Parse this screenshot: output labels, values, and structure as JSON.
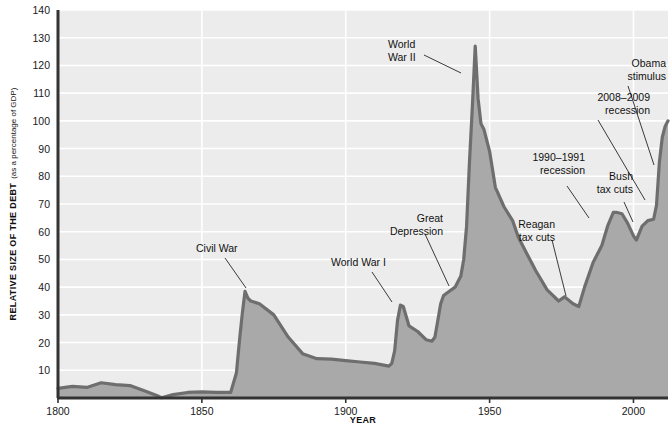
{
  "figure": {
    "background": "#ffffff",
    "plot_background": "#ececec",
    "gridline_color": "#ffffff",
    "fill_color": "#a9a9a9",
    "line_color": "#6e6e6e",
    "axis_color": "#333333",
    "text_color": "#111111"
  },
  "axes": {
    "y_title_bold": "RELATIVE SIZE OF THE DEBT",
    "y_title_regular": "(as a percentage of GDP)",
    "x_title": "YEAR",
    "y_ticks": [
      "10",
      "20",
      "30",
      "40",
      "50",
      "60",
      "70",
      "80",
      "90",
      "100",
      "110",
      "120",
      "130",
      "140"
    ],
    "x_ticks": [
      "1800",
      "1850",
      "1900",
      "1950",
      "2000"
    ]
  },
  "annotations": [
    {
      "name": "civil-war",
      "lines": [
        "Civil War"
      ]
    },
    {
      "name": "world-war-i",
      "lines": [
        "World War I"
      ]
    },
    {
      "name": "great-depression",
      "lines": [
        "Great",
        "Depression"
      ]
    },
    {
      "name": "world-war-ii",
      "lines": [
        "World",
        "War II"
      ]
    },
    {
      "name": "reagan-tax-cuts",
      "lines": [
        "Reagan",
        "tax cuts"
      ]
    },
    {
      "name": "recession-1990-1991",
      "lines": [
        "1990–1991",
        "recession"
      ]
    },
    {
      "name": "bush-tax-cuts",
      "lines": [
        "Bush",
        "tax cuts"
      ]
    },
    {
      "name": "recession-2008-2009",
      "lines": [
        "2008–2009",
        "recession"
      ]
    },
    {
      "name": "obama-stimulus",
      "lines": [
        "Obama",
        "stimulus"
      ]
    }
  ],
  "chart_data": {
    "type": "area",
    "title": "",
    "xlabel": "YEAR",
    "ylabel": "RELATIVE SIZE OF THE DEBT (as a percentage of GDP)",
    "xlim": [
      1800,
      2012
    ],
    "ylim": [
      0,
      140
    ],
    "ytick_values": [
      10,
      20,
      30,
      40,
      50,
      60,
      70,
      80,
      90,
      100,
      110,
      120,
      130,
      140
    ],
    "xtick_values": [
      1800,
      1850,
      1900,
      1950,
      2000
    ],
    "grid": "horizontal-white",
    "legend": "none",
    "series": [
      {
        "name": "U.S. federal debt as a percentage of GDP",
        "x": [
          1800,
          1805,
          1810,
          1815,
          1820,
          1825,
          1830,
          1835,
          1836,
          1840,
          1845,
          1850,
          1855,
          1860,
          1862,
          1863,
          1864,
          1865,
          1866,
          1867,
          1870,
          1875,
          1880,
          1885,
          1890,
          1895,
          1900,
          1905,
          1910,
          1915,
          1916,
          1917,
          1918,
          1919,
          1920,
          1922,
          1925,
          1928,
          1930,
          1931,
          1932,
          1933,
          1934,
          1936,
          1938,
          1940,
          1941,
          1942,
          1943,
          1944,
          1945,
          1946,
          1947,
          1948,
          1950,
          1952,
          1955,
          1958,
          1960,
          1963,
          1966,
          1970,
          1974,
          1976,
          1979,
          1981,
          1983,
          1986,
          1989,
          1991,
          1993,
          1994,
          1996,
          1998,
          2000,
          2001,
          2003,
          2005,
          2007,
          2008,
          2009,
          2010,
          2011,
          2012
        ],
        "values": [
          3.5,
          4.2,
          3.8,
          5.5,
          4.8,
          4.5,
          2.6,
          0.6,
          0.1,
          1.2,
          2.0,
          2.2,
          2.0,
          2.0,
          9.0,
          20.0,
          30.0,
          38.5,
          36.0,
          35.0,
          34.0,
          30.0,
          22.0,
          16.0,
          14.2,
          14.0,
          13.5,
          13.0,
          12.5,
          11.5,
          12.5,
          17.0,
          28.0,
          33.5,
          33.0,
          26.0,
          24.0,
          21.0,
          20.5,
          22.0,
          28.0,
          34.0,
          37.0,
          38.5,
          40.0,
          44.0,
          50.0,
          62.0,
          85.0,
          105.0,
          127.0,
          108.0,
          99.0,
          97.0,
          89.0,
          76.0,
          69.0,
          64.0,
          58.0,
          52.0,
          46.0,
          39.0,
          35.0,
          36.5,
          34.0,
          33.0,
          40.0,
          49.0,
          55.0,
          62.0,
          67.0,
          67.0,
          66.5,
          63.0,
          58.5,
          57.0,
          62.0,
          64.0,
          64.5,
          69.5,
          85.0,
          94.0,
          98.0,
          100.0
        ]
      }
    ]
  }
}
